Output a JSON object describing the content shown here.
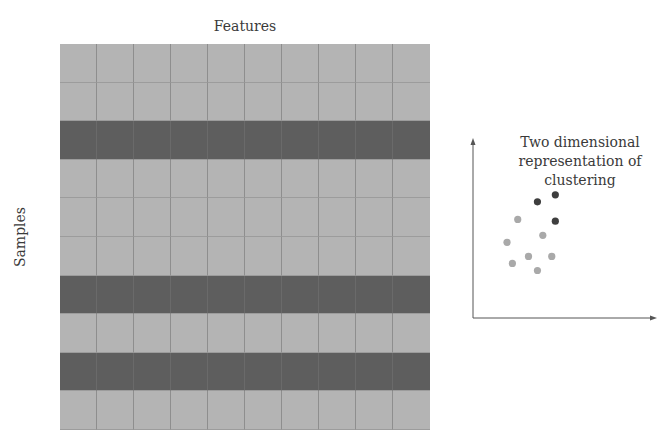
{
  "heatmap": {
    "column_label": "Features",
    "row_label": "Samples",
    "rows": 10,
    "columns": 10,
    "row_shades": [
      "light",
      "light",
      "dark",
      "light",
      "light",
      "light",
      "dark",
      "light",
      "dark",
      "light"
    ]
  },
  "scatter": {
    "title": "Two dimensional representation of clustering",
    "title_lines": [
      "Two dimensional",
      "representation of",
      "clustering"
    ],
    "points": [
      {
        "x": 0.36,
        "y": 0.66,
        "cluster": "dark"
      },
      {
        "x": 0.46,
        "y": 0.7,
        "cluster": "dark"
      },
      {
        "x": 0.46,
        "y": 0.55,
        "cluster": "dark"
      },
      {
        "x": 0.25,
        "y": 0.56,
        "cluster": "light"
      },
      {
        "x": 0.39,
        "y": 0.47,
        "cluster": "light"
      },
      {
        "x": 0.19,
        "y": 0.43,
        "cluster": "light"
      },
      {
        "x": 0.31,
        "y": 0.35,
        "cluster": "light"
      },
      {
        "x": 0.44,
        "y": 0.35,
        "cluster": "light"
      },
      {
        "x": 0.22,
        "y": 0.31,
        "cluster": "light"
      },
      {
        "x": 0.36,
        "y": 0.27,
        "cluster": "light"
      }
    ],
    "colors": {
      "dark": "#3e3e3e",
      "light": "#a9a9a9"
    }
  },
  "chart_data": {
    "type": "heatmap",
    "title": "",
    "xlabel": "Features",
    "ylabel": "Samples",
    "rows": 10,
    "columns": 10,
    "row_groups": [
      "light",
      "light",
      "dark",
      "light",
      "light",
      "light",
      "dark",
      "light",
      "dark",
      "light"
    ],
    "inset": {
      "type": "scatter",
      "title": "Two dimensional representation of clustering",
      "series": [
        {
          "name": "dark cluster",
          "points": [
            [
              0.36,
              0.66
            ],
            [
              0.46,
              0.7
            ],
            [
              0.46,
              0.55
            ]
          ]
        },
        {
          "name": "light cluster",
          "points": [
            [
              0.25,
              0.56
            ],
            [
              0.39,
              0.47
            ],
            [
              0.19,
              0.43
            ],
            [
              0.31,
              0.35
            ],
            [
              0.44,
              0.35
            ],
            [
              0.22,
              0.31
            ],
            [
              0.36,
              0.27
            ]
          ]
        }
      ],
      "xlim": [
        0,
        1
      ],
      "ylim": [
        0,
        1
      ]
    }
  }
}
